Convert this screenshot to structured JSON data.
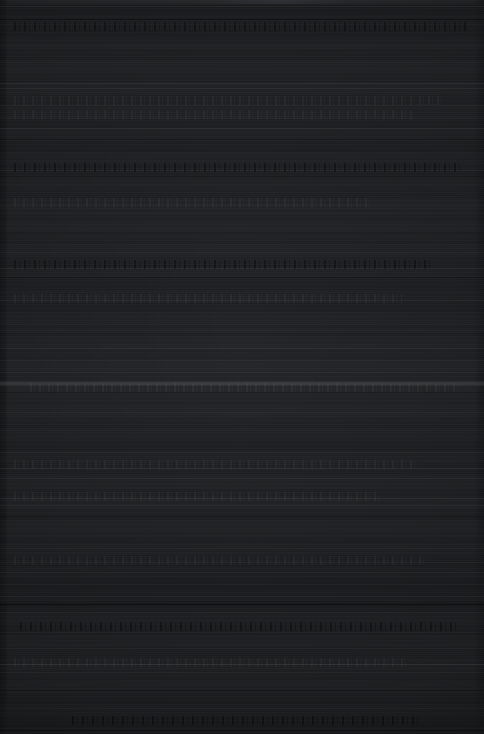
{
  "capture": {
    "width": 484,
    "height": 734,
    "description": "Near-black dark-theme application window capture; contents are not legible at any magnification.",
    "legible_text": "",
    "background_color": "#212225",
    "darkest_color": "#171819",
    "lightest_color": "#34353a"
  },
  "regions": {
    "titlebar_sliver": {
      "top": 0,
      "height": 4,
      "color": "#2b2c2f"
    },
    "left_gutter": {
      "left": 0,
      "width": 8,
      "color": "#171819"
    },
    "right_edge": {
      "right": 0,
      "width": 10,
      "color": "#1a1b1e"
    }
  },
  "dividers": [
    {
      "y": 6,
      "color": "rgba(255,255,255,0.055)"
    },
    {
      "y": 19,
      "color": "rgba(0,0,0,0.45)"
    },
    {
      "y": 45,
      "color": "rgba(255,255,255,0.030)"
    },
    {
      "y": 62,
      "color": "rgba(255,255,255,0.022)"
    },
    {
      "y": 83,
      "color": "rgba(255,255,255,0.070)"
    },
    {
      "y": 88,
      "color": "rgba(255,255,255,0.048)"
    },
    {
      "y": 105,
      "color": "rgba(255,255,255,0.060)"
    },
    {
      "y": 118,
      "color": "rgba(255,255,255,0.040)"
    },
    {
      "y": 128,
      "color": "rgba(255,255,255,0.072)"
    },
    {
      "y": 139,
      "color": "rgba(0,0,0,0.30)"
    },
    {
      "y": 153,
      "color": "rgba(255,255,255,0.020)"
    },
    {
      "y": 170,
      "color": "rgba(255,255,255,0.055)"
    },
    {
      "y": 176,
      "color": "rgba(0,0,0,0.34)"
    },
    {
      "y": 205,
      "color": "rgba(255,255,255,0.036)"
    },
    {
      "y": 213,
      "color": "rgba(255,255,255,0.026)"
    },
    {
      "y": 232,
      "color": "rgba(0,0,0,0.26)"
    },
    {
      "y": 252,
      "color": "rgba(255,255,255,0.018)"
    },
    {
      "y": 268,
      "color": "rgba(255,255,255,0.042)"
    },
    {
      "y": 277,
      "color": "rgba(0,0,0,0.30)"
    },
    {
      "y": 300,
      "color": "rgba(255,255,255,0.030)"
    },
    {
      "y": 312,
      "color": "rgba(255,255,255,0.022)"
    },
    {
      "y": 330,
      "color": "rgba(255,255,255,0.038)"
    },
    {
      "y": 348,
      "color": "rgba(255,255,255,0.050)"
    },
    {
      "y": 360,
      "color": "rgba(255,255,255,0.026)"
    },
    {
      "y": 372,
      "color": "rgba(255,255,255,0.044)"
    },
    {
      "y": 392,
      "color": "rgba(0,0,0,0.36)"
    },
    {
      "y": 412,
      "color": "rgba(255,255,255,0.024)"
    },
    {
      "y": 430,
      "color": "rgba(255,255,255,0.020)"
    },
    {
      "y": 452,
      "color": "rgba(255,255,255,0.030)"
    },
    {
      "y": 468,
      "color": "rgba(255,255,255,0.062)"
    },
    {
      "y": 478,
      "color": "rgba(255,255,255,0.048)"
    },
    {
      "y": 487,
      "color": "rgba(255,255,255,0.028)"
    },
    {
      "y": 498,
      "color": "rgba(255,255,255,0.066)"
    },
    {
      "y": 505,
      "color": "rgba(255,255,255,0.052)"
    },
    {
      "y": 516,
      "color": "rgba(0,0,0,0.30)"
    },
    {
      "y": 535,
      "color": "rgba(255,255,255,0.030)"
    },
    {
      "y": 548,
      "color": "rgba(255,255,255,0.024)"
    },
    {
      "y": 562,
      "color": "rgba(255,255,255,0.046)"
    },
    {
      "y": 572,
      "color": "rgba(255,255,255,0.032)"
    },
    {
      "y": 584,
      "color": "rgba(255,255,255,0.028)"
    },
    {
      "y": 596,
      "color": "rgba(255,255,255,0.040)"
    },
    {
      "y": 604,
      "color": "rgba(0,0,0,0.62)"
    },
    {
      "y": 612,
      "color": "rgba(255,255,255,0.026)"
    },
    {
      "y": 632,
      "color": "rgba(255,255,255,0.022)"
    },
    {
      "y": 648,
      "color": "rgba(255,255,255,0.030)"
    },
    {
      "y": 664,
      "color": "rgba(255,255,255,0.085)"
    },
    {
      "y": 672,
      "color": "rgba(255,255,255,0.034)"
    },
    {
      "y": 690,
      "color": "rgba(0,0,0,0.28)"
    },
    {
      "y": 708,
      "color": "rgba(255,255,255,0.020)"
    },
    {
      "y": 730,
      "color": "rgba(0,0,0,0.40)"
    }
  ],
  "highlight_band": {
    "y": 381,
    "height": 5
  },
  "text_bands": [
    {
      "y": 22,
      "left": 14,
      "width": 452,
      "tone": "dark"
    },
    {
      "y": 96,
      "left": 14,
      "width": 430,
      "tone": "light"
    },
    {
      "y": 110,
      "left": 14,
      "width": 398,
      "tone": "light"
    },
    {
      "y": 163,
      "left": 14,
      "width": 446,
      "tone": "dark"
    },
    {
      "y": 198,
      "left": 14,
      "width": 360,
      "tone": "light"
    },
    {
      "y": 260,
      "left": 14,
      "width": 420,
      "tone": "dark"
    },
    {
      "y": 294,
      "left": 14,
      "width": 388,
      "tone": "light"
    },
    {
      "y": 383,
      "left": 30,
      "width": 430,
      "tone": "light"
    },
    {
      "y": 460,
      "left": 14,
      "width": 404,
      "tone": "light"
    },
    {
      "y": 492,
      "left": 14,
      "width": 366,
      "tone": "light"
    },
    {
      "y": 556,
      "left": 14,
      "width": 412,
      "tone": "light"
    },
    {
      "y": 622,
      "left": 20,
      "width": 440,
      "tone": "dark"
    },
    {
      "y": 658,
      "left": 14,
      "width": 396,
      "tone": "light"
    },
    {
      "y": 716,
      "left": 72,
      "width": 348,
      "tone": "dark"
    }
  ]
}
